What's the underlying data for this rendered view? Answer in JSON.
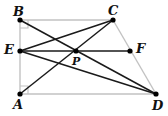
{
  "figure": {
    "type": "geometry-diagram",
    "width": 168,
    "height": 116,
    "background_color": "#ffffff",
    "outline_color": "#bcbcbc",
    "segment_color": "#1a1a1a",
    "vertex_color": "#000000",
    "label_color": "#111111"
  },
  "points": [
    {
      "name": "B",
      "label": "B",
      "x": 20,
      "y": 20,
      "label_x": 13,
      "label_y": 5,
      "dot": true
    },
    {
      "name": "C",
      "label": "C",
      "x": 113,
      "y": 20,
      "label_x": 108,
      "label_y": 4,
      "dot": true
    },
    {
      "name": "E",
      "label": "E",
      "x": 20,
      "y": 51,
      "label_x": 4,
      "label_y": 43,
      "dot": true
    },
    {
      "name": "P",
      "label": "P",
      "x": 76,
      "y": 51,
      "label_x": 72,
      "label_y": 56,
      "dot": true
    },
    {
      "name": "F",
      "label": "F",
      "x": 130,
      "y": 51,
      "label_x": 136,
      "label_y": 42,
      "dot": true
    },
    {
      "name": "A",
      "label": "A",
      "x": 20,
      "y": 94,
      "label_x": 13,
      "label_y": 98,
      "dot": true
    },
    {
      "name": "D",
      "label": "D",
      "x": 156,
      "y": 94,
      "label_x": 152,
      "label_y": 99,
      "dot": true
    }
  ],
  "outline_edges": [
    {
      "name": "edge-BC",
      "from": "B",
      "to": "C"
    },
    {
      "name": "edge-BA",
      "from": "B",
      "to": "A"
    },
    {
      "name": "edge-AD",
      "from": "A",
      "to": "D"
    },
    {
      "name": "edge-CD",
      "from": "C",
      "to": "D"
    }
  ],
  "segments": [
    {
      "name": "segment-EF",
      "from": "E",
      "to": "F"
    },
    {
      "name": "segment-BD",
      "from": "B",
      "to": "D"
    },
    {
      "name": "segment-ED",
      "from": "E",
      "to": "D"
    },
    {
      "name": "segment-EC",
      "from": "E",
      "to": "C"
    },
    {
      "name": "segment-AC",
      "from": "A",
      "to": "C"
    },
    {
      "name": "segment-BP",
      "from": "B",
      "to": "P"
    }
  ],
  "right_angle_marks": [
    {
      "name": "right-angle-A",
      "at": "A"
    },
    {
      "name": "right-angle-B",
      "at": "B"
    }
  ]
}
